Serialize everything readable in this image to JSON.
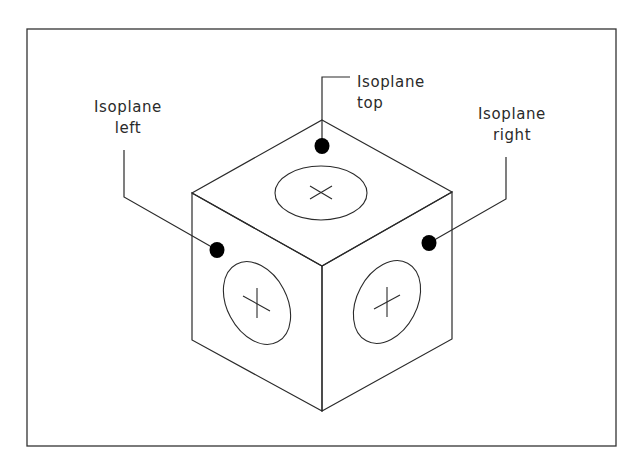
{
  "figure": {
    "frame": {
      "x": 27,
      "y": 29,
      "width": 589,
      "height": 417,
      "stroke": "#333333"
    },
    "stroke_color": "#2a2a2a",
    "dot_color": "#000000",
    "cube": {
      "top_apex": [
        322,
        120
      ],
      "left_top": [
        192,
        193
      ],
      "right_top": [
        452,
        192
      ],
      "front_top": [
        322,
        266
      ],
      "left_bottom": [
        192,
        340
      ],
      "right_bottom": [
        452,
        339
      ],
      "front_bottom": [
        322,
        411
      ]
    },
    "ellipses": [
      {
        "face": "top",
        "cx": 321,
        "cy": 193,
        "rx": 46,
        "ry": 27,
        "rotate": 0
      },
      {
        "face": "left",
        "cx": 257,
        "cy": 303,
        "rx": 45,
        "ry": 30,
        "rotate": 62
      },
      {
        "face": "right",
        "cx": 387,
        "cy": 302,
        "rx": 45,
        "ry": 30,
        "rotate": -62
      }
    ],
    "labels": {
      "top": {
        "line1": "Isoplane",
        "line2": "top"
      },
      "left": {
        "line1": "Isoplane",
        "line2": "left"
      },
      "right": {
        "line1": "Isoplane",
        "line2": "right"
      }
    },
    "leaders": [
      {
        "name": "top",
        "points": [
          [
            350,
            77
          ],
          [
            322,
            77
          ],
          [
            322,
            146
          ]
        ],
        "dot": [
          322,
          146
        ]
      },
      {
        "name": "left",
        "points": [
          [
            124,
            150
          ],
          [
            124,
            197
          ],
          [
            217,
            250
          ]
        ],
        "dot": [
          217,
          250
        ]
      },
      {
        "name": "right",
        "points": [
          [
            506,
            157
          ],
          [
            506,
            199
          ],
          [
            429,
            243
          ]
        ],
        "dot": [
          429,
          243
        ]
      }
    ]
  }
}
